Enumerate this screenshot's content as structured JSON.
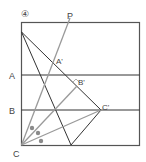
{
  "diagram": {
    "step_label": "④",
    "labels": {
      "P": "P",
      "A": "A",
      "B": "B",
      "C": "C",
      "A_prime": "A'",
      "B_prime": "B'",
      "C_prime": "C'"
    },
    "colors": {
      "frame": "#555555",
      "line_dark": "#333333",
      "line_gray": "#9a9a9a",
      "angle_mark": "#8a8a8a"
    },
    "angle_marks": 3,
    "right_angle_at": "B'"
  }
}
